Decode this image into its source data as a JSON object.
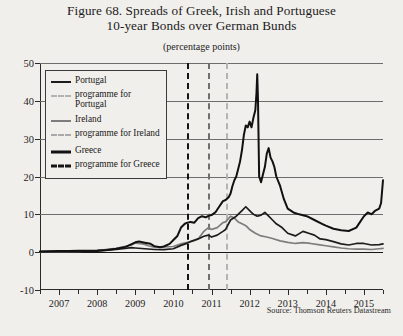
{
  "figure": {
    "title_line1": "Figure 68. Spreads of Greek, Irish and Portuguese",
    "title_line2": "10-year Bonds over German Bunds",
    "subtitle": "(percentage points)",
    "source": "Source: Thomson Reuters Datastream"
  },
  "colors": {
    "greece": "#111111",
    "portugal": "#1c1c1c",
    "ireland": "#7d7d7d",
    "programme_greece": "#141414",
    "programme_ireland": "#6f6f6f",
    "programme_portugal": "#b3b3b3",
    "background": "#f1efec",
    "grid": "#6d6d6d",
    "axis": "#2a2a2a"
  },
  "legend": {
    "items": [
      {
        "label": "Portugal",
        "key": "solid",
        "color": "#1c1c1c",
        "width": 2.6,
        "name": "legend-portugal"
      },
      {
        "label": "programme for Portugal",
        "key": "dashed",
        "color": "#b3b3b3",
        "width": 2.6,
        "name": "legend-programme-portugal"
      },
      {
        "label": "Ireland",
        "key": "solid",
        "color": "#7d7d7d",
        "width": 2.6,
        "name": "legend-ireland"
      },
      {
        "label": "programme for Ireland",
        "key": "dashed",
        "color": "#a9a9a9",
        "width": 2.6,
        "name": "legend-programme-ireland"
      },
      {
        "label": "Greece",
        "key": "solid",
        "color": "#111111",
        "width": 3.2,
        "name": "legend-greece"
      },
      {
        "label": "programme for Greece",
        "key": "dashed",
        "color": "#141414",
        "width": 3.2,
        "name": "legend-programme-greece"
      }
    ]
  },
  "chart_data": {
    "type": "line",
    "title": "Figure 68. Spreads of Greek, Irish and Portuguese 10-year Bonds over German Bunds",
    "subtitle": "(percentage points)",
    "xlabel": "",
    "ylabel": "percentage points",
    "xlim": [
      2006.5,
      2015.5
    ],
    "ylim": [
      -10,
      50
    ],
    "yticks": [
      50,
      40,
      30,
      20,
      10,
      0,
      -10
    ],
    "xticks": [
      2007,
      2008,
      2009,
      2010,
      2011,
      2012,
      2013,
      2014,
      2015
    ],
    "grid": true,
    "legend_position": "upper-left-inside",
    "zero_line": 0,
    "annotations": [
      {
        "type": "vline",
        "label": "programme for Greece",
        "x": 2010.37,
        "color": "#141414"
      },
      {
        "type": "vline",
        "label": "programme for Ireland",
        "x": 2010.92,
        "color": "#6f6f6f"
      },
      {
        "type": "vline",
        "label": "programme for Portugal",
        "x": 2011.37,
        "color": "#b3b3b3"
      }
    ],
    "series": [
      {
        "name": "Greece",
        "color": "#111111",
        "x": [
          2006.5,
          2006.75,
          2007.0,
          2007.25,
          2007.5,
          2007.75,
          2008.0,
          2008.25,
          2008.5,
          2008.75,
          2009.0,
          2009.1,
          2009.25,
          2009.4,
          2009.5,
          2009.65,
          2009.75,
          2009.9,
          2010.0,
          2010.1,
          2010.2,
          2010.3,
          2010.37,
          2010.45,
          2010.55,
          2010.65,
          2010.75,
          2010.85,
          2010.92,
          2011.0,
          2011.1,
          2011.2,
          2011.3,
          2011.37,
          2011.45,
          2011.5,
          2011.55,
          2011.6,
          2011.65,
          2011.7,
          2011.75,
          2011.8,
          2011.85,
          2011.9,
          2011.95,
          2012.0,
          2012.05,
          2012.1,
          2012.15,
          2012.18,
          2012.2,
          2012.22,
          2012.25,
          2012.3,
          2012.35,
          2012.4,
          2012.45,
          2012.5,
          2012.55,
          2012.6,
          2012.65,
          2012.7,
          2012.8,
          2012.9,
          2013.0,
          2013.15,
          2013.3,
          2013.5,
          2013.7,
          2013.9,
          2014.0,
          2014.2,
          2014.4,
          2014.6,
          2014.8,
          2014.9,
          2015.0,
          2015.1,
          2015.2,
          2015.3,
          2015.4,
          2015.45,
          2015.5
        ],
        "y": [
          0.2,
          0.25,
          0.3,
          0.3,
          0.35,
          0.4,
          0.45,
          0.6,
          0.9,
          1.4,
          2.6,
          2.8,
          2.5,
          2.2,
          1.6,
          1.3,
          1.5,
          2.2,
          3.2,
          4.2,
          6.5,
          7.5,
          7.8,
          8.0,
          7.8,
          9.0,
          9.5,
          9.2,
          9.6,
          9.8,
          10.5,
          12.0,
          13.5,
          13.8,
          14.5,
          15.5,
          17.5,
          19.0,
          20.0,
          22.0,
          24.0,
          27.0,
          31.0,
          33.5,
          33.0,
          34.5,
          33.0,
          35.5,
          37.5,
          42.0,
          47.0,
          40.0,
          20.0,
          18.5,
          20.5,
          22.5,
          26.0,
          27.5,
          25.0,
          24.0,
          22.5,
          20.0,
          17.5,
          14.0,
          11.5,
          10.5,
          10.0,
          9.5,
          8.5,
          7.5,
          7.0,
          6.2,
          5.8,
          5.6,
          6.5,
          8.0,
          9.5,
          10.5,
          10.0,
          11.0,
          11.5,
          13.0,
          19.0
        ]
      },
      {
        "name": "Portugal",
        "color": "#1c1c1c",
        "x": [
          2006.5,
          2007.0,
          2007.5,
          2008.0,
          2008.5,
          2008.9,
          2009.0,
          2009.25,
          2009.5,
          2009.75,
          2010.0,
          2010.2,
          2010.37,
          2010.5,
          2010.65,
          2010.8,
          2010.92,
          2011.0,
          2011.15,
          2011.3,
          2011.37,
          2011.5,
          2011.65,
          2011.8,
          2011.9,
          2012.0,
          2012.1,
          2012.2,
          2012.3,
          2012.4,
          2012.5,
          2012.6,
          2012.7,
          2012.85,
          2013.0,
          2013.2,
          2013.4,
          2013.55,
          2013.7,
          2013.85,
          2014.0,
          2014.2,
          2014.4,
          2014.6,
          2014.8,
          2015.0,
          2015.2,
          2015.4,
          2015.5
        ],
        "y": [
          0.15,
          0.2,
          0.25,
          0.3,
          0.7,
          1.2,
          1.1,
          0.9,
          0.7,
          0.65,
          0.9,
          1.8,
          2.4,
          3.0,
          3.5,
          4.2,
          4.5,
          4.0,
          4.5,
          5.5,
          6.0,
          8.5,
          9.5,
          11.0,
          12.0,
          11.0,
          10.0,
          9.5,
          9.8,
          10.5,
          9.5,
          8.5,
          7.5,
          6.5,
          5.0,
          4.3,
          5.5,
          5.0,
          4.5,
          3.5,
          3.3,
          2.8,
          2.2,
          1.9,
          2.3,
          2.3,
          1.9,
          2.0,
          2.2
        ]
      },
      {
        "name": "Ireland",
        "color": "#7d7d7d",
        "x": [
          2006.5,
          2007.0,
          2007.5,
          2008.0,
          2008.5,
          2008.9,
          2009.0,
          2009.2,
          2009.35,
          2009.5,
          2009.75,
          2010.0,
          2010.2,
          2010.37,
          2010.5,
          2010.65,
          2010.8,
          2010.92,
          2011.0,
          2011.15,
          2011.3,
          2011.37,
          2011.5,
          2011.6,
          2011.7,
          2011.8,
          2011.9,
          2012.0,
          2012.15,
          2012.3,
          2012.45,
          2012.6,
          2012.8,
          2013.0,
          2013.2,
          2013.4,
          2013.6,
          2013.8,
          2014.0,
          2014.2,
          2014.4,
          2014.6,
          2014.8,
          2015.0,
          2015.2,
          2015.4,
          2015.5
        ],
        "y": [
          0.1,
          0.15,
          0.2,
          0.4,
          1.0,
          1.9,
          2.4,
          2.2,
          1.7,
          1.3,
          1.4,
          1.5,
          2.2,
          2.6,
          2.9,
          3.5,
          5.5,
          6.5,
          6.0,
          6.5,
          7.8,
          8.0,
          9.5,
          9.0,
          8.0,
          7.5,
          7.0,
          6.0,
          5.0,
          4.3,
          4.0,
          3.6,
          3.0,
          2.6,
          2.3,
          2.5,
          2.3,
          2.0,
          1.7,
          1.4,
          1.1,
          0.9,
          0.8,
          0.8,
          0.7,
          0.9,
          1.0
        ]
      }
    ]
  }
}
